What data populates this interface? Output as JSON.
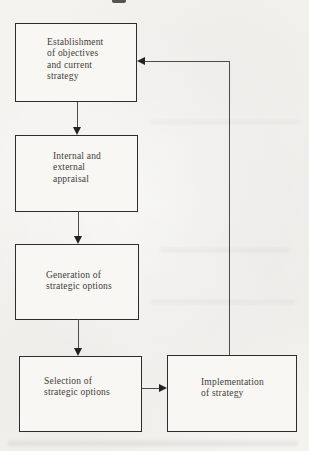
{
  "colors": {
    "page_bg": "#f4f3f0",
    "box_bg": "#f8f7f4",
    "box_border": "#2f2d2b",
    "line": "#4d4b49",
    "text": "#3f3d3a"
  },
  "flowchart": {
    "nodes": [
      {
        "id": "establishment",
        "label": "Establishment\nof objectives\nand current\nstrategy"
      },
      {
        "id": "appraisal",
        "label": "Internal and\nexternal\nappraisal"
      },
      {
        "id": "generation",
        "label": "Generation of\nstrategic options"
      },
      {
        "id": "selection",
        "label": "Selection of\nstrategic options"
      },
      {
        "id": "implementation",
        "label": "Implementation\nof strategy"
      }
    ],
    "edges": [
      {
        "from": "establishment",
        "to": "appraisal",
        "direction": "down"
      },
      {
        "from": "appraisal",
        "to": "generation",
        "direction": "down"
      },
      {
        "from": "generation",
        "to": "selection",
        "direction": "down"
      },
      {
        "from": "selection",
        "to": "implementation",
        "direction": "right"
      },
      {
        "from": "implementation",
        "to": "establishment",
        "direction": "up-then-left-feedback"
      }
    ]
  }
}
